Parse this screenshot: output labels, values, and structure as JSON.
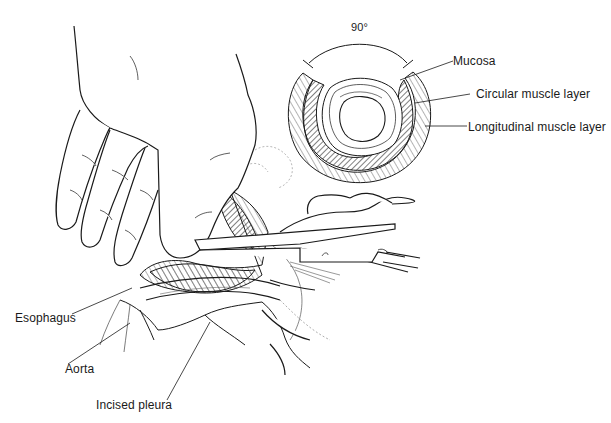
{
  "figure": {
    "colors": {
      "ink": "#1a1a1a",
      "background": "#ffffff",
      "hatch": "#3a3a3a"
    }
  },
  "cross_section": {
    "angle_label": "90°",
    "labels": {
      "mucosa": "Mucosa",
      "circular": "Circular muscle layer",
      "longitudinal": "Longitudinal muscle layer"
    }
  },
  "operative_field": {
    "labels": {
      "esophagus": "Esophagus",
      "aorta": "Aorta",
      "pleura": "Incised pleura"
    },
    "instruments": [
      "scissors",
      "forceps"
    ],
    "hands": [
      "left hand retracting",
      "right hand holding scissors"
    ]
  }
}
